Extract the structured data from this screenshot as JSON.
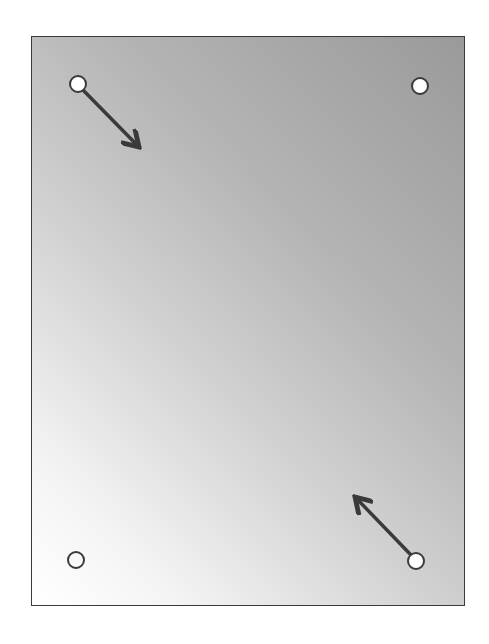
{
  "diagram": {
    "type": "panel-with-corner-holes",
    "panel": {
      "x": 31,
      "y": 36,
      "width": 434,
      "height": 570,
      "border_color": "#3a3a3a",
      "gradient": {
        "direction": "top-right dark to bottom-left light",
        "dark": "#9a9a9a",
        "light": "#ffffff"
      }
    },
    "holes": [
      {
        "id": "top-left",
        "cx": 78,
        "cy": 84,
        "r": 8,
        "fill": "#ffffff",
        "has_arrow": true
      },
      {
        "id": "top-right",
        "cx": 420,
        "cy": 86,
        "r": 8,
        "fill": "#ffffff",
        "has_arrow": false
      },
      {
        "id": "bottom-left",
        "cx": 76,
        "cy": 560,
        "r": 8,
        "fill": "none",
        "has_arrow": false
      },
      {
        "id": "bottom-right",
        "cx": 416,
        "cy": 561,
        "r": 8,
        "fill": "#ffffff",
        "has_arrow": true
      }
    ],
    "arrows": [
      {
        "id": "arrow-top-left",
        "from": [
          83,
          90
        ],
        "to": [
          137,
          145
        ],
        "direction": "down-right",
        "color": "#3a3a3a"
      },
      {
        "id": "arrow-bottom-right",
        "from": [
          411,
          555
        ],
        "to": [
          357,
          499
        ],
        "direction": "up-left",
        "color": "#3a3a3a"
      }
    ],
    "colors": {
      "stroke": "#3a3a3a",
      "hole_fill": "#ffffff"
    }
  }
}
